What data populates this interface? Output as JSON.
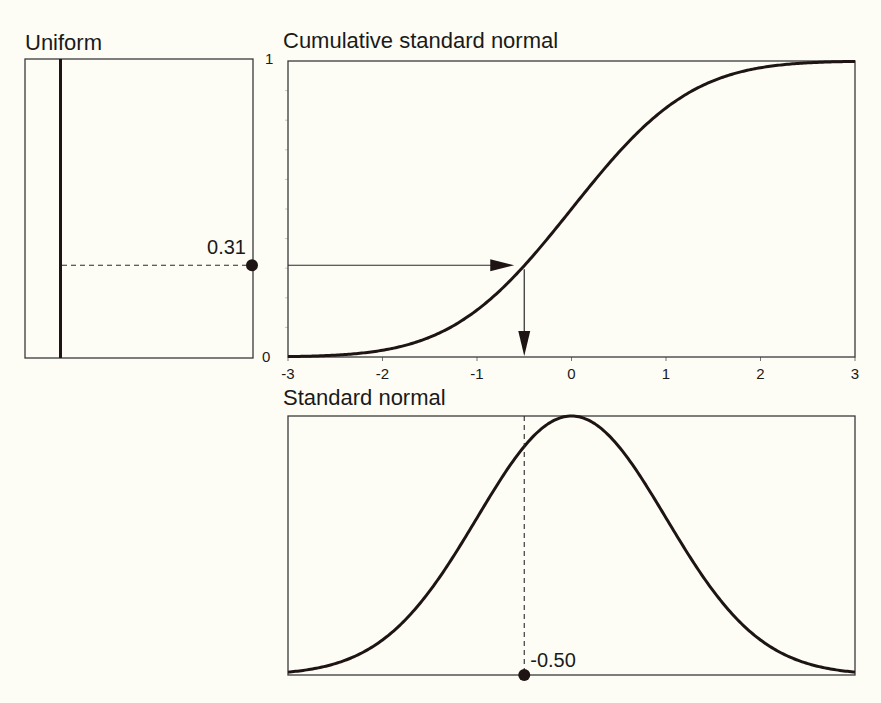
{
  "colors": {
    "background": "#fdfdf5",
    "ink": "#1e1414"
  },
  "chart_data": [
    {
      "id": "uniform",
      "type": "line",
      "title": "Uniform",
      "description": "Uniform density on [0,1] drawn as vertical line; sampled value marked on right axis",
      "ylim": [
        0,
        1
      ],
      "sample_value": 0.31,
      "sample_label": "0.31"
    },
    {
      "id": "cdf",
      "type": "line",
      "title": "Cumulative standard normal",
      "xlim": [
        -3,
        3
      ],
      "ylim": [
        0,
        1
      ],
      "x_ticks": [
        -3,
        -2,
        -1,
        0,
        1,
        2,
        3
      ],
      "x_tick_labels": [
        "-3",
        "-2",
        "-1",
        "0",
        "1",
        "2",
        "3"
      ],
      "y_tick_labels": [
        "0",
        "1"
      ],
      "y_minor_step": 0.1,
      "function": "standard normal CDF",
      "inverse_lookup": {
        "probability": 0.31,
        "quantile": -0.5
      }
    },
    {
      "id": "pdf",
      "type": "line",
      "title": "Standard normal",
      "xlim": [
        -3,
        3
      ],
      "function": "standard normal PDF",
      "marked_x": -0.5,
      "marked_label": "-0.50"
    }
  ]
}
